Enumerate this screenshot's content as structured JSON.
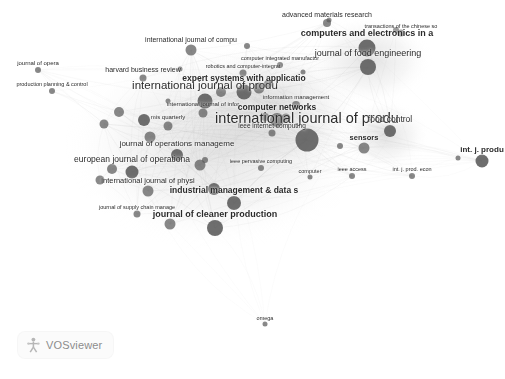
{
  "app": {
    "name": "VOSviewer",
    "logo_label": "VOSviewer",
    "logo_icon": "vosviewer-mark-icon"
  },
  "visualization": {
    "type": "bibliometric-network",
    "background_color": "#ffffff",
    "node_color": "#5a5a5a",
    "edge_color": "#b4b4b4",
    "label_color": "#2b2b2b"
  },
  "chart_data": {
    "type": "scatter",
    "title": "",
    "xlabel": "",
    "ylabel": "",
    "grid": false,
    "legend_position": "none",
    "nodes": [
      {
        "label": "international journal of produ",
        "x": 307,
        "y": 140,
        "r": 11.5,
        "fs": 14.5,
        "w": "normal"
      },
      {
        "label": "international journal of produ",
        "x": 205,
        "y": 101,
        "r": 7.5,
        "fs": 11.5,
        "w": "normal"
      },
      {
        "label": "journal of operations manageme",
        "x": 177,
        "y": 155,
        "r": 6.0,
        "fs": 8.0,
        "w": "normal"
      },
      {
        "label": "european journal of operationa",
        "x": 132,
        "y": 172,
        "r": 6.5,
        "fs": 8.5,
        "w": "normal"
      },
      {
        "label": "international journal of physi",
        "x": 148,
        "y": 191,
        "r": 5.5,
        "fs": 7.5,
        "w": "normal"
      },
      {
        "label": "industrial management & data s",
        "x": 234,
        "y": 203,
        "r": 7.0,
        "fs": 8.5,
        "w": "bold"
      },
      {
        "label": "journal of cleaner production",
        "x": 215,
        "y": 228,
        "r": 8.0,
        "fs": 9.0,
        "w": "bold"
      },
      {
        "label": "journal of supply chain manage",
        "x": 137,
        "y": 214,
        "r": 3.5,
        "fs": 5.5,
        "w": "normal"
      },
      {
        "label": "mis quarterly",
        "x": 168,
        "y": 126,
        "r": 4.5,
        "fs": 6.0,
        "w": "normal"
      },
      {
        "label": "international journal of infor",
        "x": 203,
        "y": 113,
        "r": 4.5,
        "fs": 6.0,
        "w": "normal"
      },
      {
        "label": "harvard business review",
        "x": 143,
        "y": 78,
        "r": 3.5,
        "fs": 7.0,
        "w": "normal"
      },
      {
        "label": "production planning & control",
        "x": 52,
        "y": 91,
        "r": 3.0,
        "fs": 5.5,
        "w": "normal"
      },
      {
        "label": "journal of opera",
        "x": 38,
        "y": 70,
        "r": 3.0,
        "fs": 6.0,
        "w": "normal"
      },
      {
        "label": "international journal of compu",
        "x": 191,
        "y": 50,
        "r": 5.5,
        "fs": 7.0,
        "w": "normal"
      },
      {
        "label": "expert systems with applicatio",
        "x": 244,
        "y": 92,
        "r": 7.5,
        "fs": 8.5,
        "w": "bold"
      },
      {
        "label": "computer networks",
        "x": 277,
        "y": 120,
        "r": 7.0,
        "fs": 8.5,
        "w": "bold"
      },
      {
        "label": "information management",
        "x": 296,
        "y": 105,
        "r": 4.0,
        "fs": 6.0,
        "w": "normal"
      },
      {
        "label": "ieee internet computing",
        "x": 272,
        "y": 133,
        "r": 3.5,
        "fs": 6.5,
        "w": "normal"
      },
      {
        "label": "ieee pervasive computing",
        "x": 261,
        "y": 168,
        "r": 3.0,
        "fs": 5.5,
        "w": "normal"
      },
      {
        "label": "computer integrated manufactur",
        "x": 280,
        "y": 65,
        "r": 3.0,
        "fs": 5.5,
        "w": "normal"
      },
      {
        "label": "robotics and computer-integrat",
        "x": 243,
        "y": 73,
        "r": 3.5,
        "fs": 5.5,
        "w": "normal"
      },
      {
        "label": "advanced materials research",
        "x": 327,
        "y": 23,
        "r": 4.0,
        "fs": 7.0,
        "w": "normal"
      },
      {
        "label": "computers and electronics in a",
        "x": 367,
        "y": 48,
        "r": 8.5,
        "fs": 9.0,
        "w": "bold"
      },
      {
        "label": "transactions of the chinese so",
        "x": 401,
        "y": 33,
        "r": 3.5,
        "fs": 5.5,
        "w": "normal"
      },
      {
        "label": "journal of food engineering",
        "x": 368,
        "y": 67,
        "r": 8.0,
        "fs": 9.0,
        "w": "normal"
      },
      {
        "label": "food control",
        "x": 390,
        "y": 131,
        "r": 6.0,
        "fs": 8.5,
        "w": "normal"
      },
      {
        "label": "sensors",
        "x": 364,
        "y": 148,
        "r": 5.5,
        "fs": 7.5,
        "w": "bold"
      },
      {
        "label": "int. j. produ",
        "x": 482,
        "y": 161,
        "r": 6.5,
        "fs": 8.0,
        "w": "bold"
      },
      {
        "label": "int. j. prod. econ",
        "x": 412,
        "y": 176,
        "r": 3.0,
        "fs": 5.5,
        "w": "normal"
      },
      {
        "label": "ieee access",
        "x": 352,
        "y": 176,
        "r": 3.0,
        "fs": 5.5,
        "w": "normal"
      },
      {
        "label": "computer",
        "x": 310,
        "y": 177,
        "r": 2.5,
        "fs": 5.5,
        "w": "normal"
      },
      {
        "label": "omega",
        "x": 265,
        "y": 324,
        "r": 2.5,
        "fs": 5.5,
        "w": "normal"
      }
    ],
    "extra_nodes": [
      {
        "x": 168,
        "y": 101,
        "r": 2.5
      },
      {
        "x": 221,
        "y": 92,
        "r": 5.0
      },
      {
        "x": 259,
        "y": 88,
        "r": 5.5
      },
      {
        "x": 268,
        "y": 84,
        "r": 4.0
      },
      {
        "x": 286,
        "y": 118,
        "r": 4.5
      },
      {
        "x": 265,
        "y": 117,
        "r": 4.0
      },
      {
        "x": 303,
        "y": 72,
        "r": 2.5
      },
      {
        "x": 119,
        "y": 112,
        "r": 5.0
      },
      {
        "x": 104,
        "y": 124,
        "r": 4.5
      },
      {
        "x": 144,
        "y": 120,
        "r": 6.0
      },
      {
        "x": 150,
        "y": 137,
        "r": 5.5
      },
      {
        "x": 112,
        "y": 169,
        "r": 5.0
      },
      {
        "x": 100,
        "y": 180,
        "r": 4.5
      },
      {
        "x": 200,
        "y": 165,
        "r": 5.5
      },
      {
        "x": 214,
        "y": 189,
        "r": 6.0
      },
      {
        "x": 170,
        "y": 224,
        "r": 5.5
      },
      {
        "x": 247,
        "y": 46,
        "r": 3.0
      },
      {
        "x": 180,
        "y": 69,
        "r": 2.5
      },
      {
        "x": 340,
        "y": 146,
        "r": 3.0
      },
      {
        "x": 458,
        "y": 158,
        "r": 2.5
      },
      {
        "x": 329,
        "y": 20,
        "r": 2.5
      },
      {
        "x": 396,
        "y": 30,
        "r": 3.0
      },
      {
        "x": 205,
        "y": 160,
        "r": 3.0
      }
    ]
  }
}
